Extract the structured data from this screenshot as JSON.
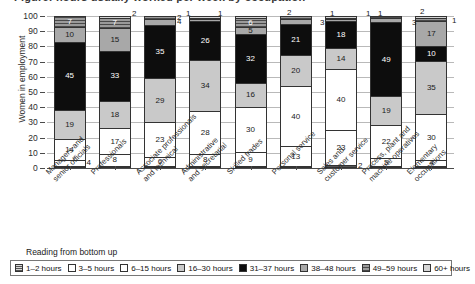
{
  "title_partial": "Figure: hours usually worked per week by occupation",
  "axis": {
    "ylabel": "Women in employment",
    "yticks": [
      "100",
      "90",
      "80",
      "70",
      "60",
      "50",
      "40",
      "30",
      "20",
      "10",
      "0"
    ],
    "ymin": 0,
    "ymax": 100
  },
  "legend": {
    "caption": "Reading from bottom up",
    "items": [
      {
        "label": "1–2 hours",
        "key": "h1"
      },
      {
        "label": "3–5 hours",
        "key": "h3"
      },
      {
        "label": "6–15 hours",
        "key": "h6"
      },
      {
        "label": "16–30 hours",
        "key": "h16"
      },
      {
        "label": "31–37 hours",
        "key": "h31"
      },
      {
        "label": "38–48 hours",
        "key": "h38"
      },
      {
        "label": "49–59 hours",
        "key": "h49"
      },
      {
        "label": "60+ hours",
        "key": "h60"
      }
    ]
  },
  "chart_data": {
    "type": "bar",
    "title": "Figure: hours usually worked per week by occupation",
    "xlabel": "",
    "ylabel": "Women in employment",
    "ylim": [
      0,
      100
    ],
    "grid": true,
    "stacked": true,
    "legend_position": "bottom",
    "categories": [
      "Managers and senior officials",
      "Professionals",
      "Associate professionals and technical",
      "Administrative and secretarial",
      "Skilled trades",
      "Personal service",
      "Sales and customer service",
      "Process, plant and machine operatives",
      "Elementary occupations"
    ],
    "series": [
      {
        "name": "1–2 hours",
        "key": "h1",
        "values": [
          1,
          1,
          1,
          1,
          1,
          1,
          2,
          1,
          1
        ]
      },
      {
        "name": "3–5 hours",
        "key": "h3",
        "values": [
          4,
          8,
          6,
          8,
          9,
          13,
          23,
          5,
          4
        ]
      },
      {
        "name": "6–15 hours",
        "key": "h6",
        "values": [
          14,
          17,
          23,
          28,
          30,
          40,
          40,
          22,
          30
        ]
      },
      {
        "name": "16–30 hours",
        "key": "h16",
        "values": [
          19,
          18,
          29,
          34,
          16,
          20,
          14,
          19,
          35
        ]
      },
      {
        "name": "31–37 hours",
        "key": "h31",
        "values": [
          45,
          33,
          35,
          26,
          32,
          21,
          18,
          49,
          10
        ]
      },
      {
        "name": "38–48 hours",
        "key": "h38",
        "values": [
          10,
          15,
          4,
          1,
          5,
          3,
          1,
          3,
          17
        ]
      },
      {
        "name": "49–59 hours",
        "key": "h49",
        "values": [
          7,
          7,
          2,
          1,
          6,
          2,
          1,
          1,
          2
        ]
      },
      {
        "name": "60+ hours",
        "key": "h60",
        "values": [
          0,
          1,
          0,
          1,
          1,
          0,
          1,
          0,
          1
        ]
      }
    ]
  },
  "bars": [
    {
      "category_l1": "Managers and",
      "category_l2": "senior officials",
      "segments": [
        {
          "key": "h1",
          "value": 1,
          "label": "",
          "callout": ""
        },
        {
          "key": "h3",
          "value": 4,
          "label": "",
          "callout": "4"
        },
        {
          "key": "h6",
          "value": 14,
          "label": "14",
          "callout": ""
        },
        {
          "key": "h16",
          "value": 19,
          "label": "19",
          "callout": ""
        },
        {
          "key": "h31",
          "value": 45,
          "label": "45",
          "callout": ""
        },
        {
          "key": "h38",
          "value": 10,
          "label": "10",
          "callout": ""
        },
        {
          "key": "h49",
          "value": 7,
          "label": "7",
          "callout": ""
        }
      ]
    },
    {
      "category_l1": "Professionals",
      "category_l2": "",
      "segments": [
        {
          "key": "h1",
          "value": 1,
          "label": "",
          "callout": ""
        },
        {
          "key": "h3",
          "value": 8,
          "label": "8",
          "callout": ""
        },
        {
          "key": "h6",
          "value": 17,
          "label": "17",
          "callout": ""
        },
        {
          "key": "h16",
          "value": 18,
          "label": "18",
          "callout": ""
        },
        {
          "key": "h31",
          "value": 33,
          "label": "33",
          "callout": ""
        },
        {
          "key": "h38",
          "value": 15,
          "label": "15",
          "callout": ""
        },
        {
          "key": "h49",
          "value": 7,
          "label": "7",
          "callout": ""
        },
        {
          "key": "h60",
          "value": 1,
          "label": "",
          "callout": ""
        }
      ]
    },
    {
      "category_l1": "Associate professionals",
      "category_l2": "and technical",
      "segments": [
        {
          "key": "h1",
          "value": 1,
          "label": "",
          "callout": ""
        },
        {
          "key": "h3",
          "value": 6,
          "label": "6",
          "callout": ""
        },
        {
          "key": "h6",
          "value": 23,
          "label": "23",
          "callout": ""
        },
        {
          "key": "h16",
          "value": 29,
          "label": "29",
          "callout": ""
        },
        {
          "key": "h31",
          "value": 35,
          "label": "35",
          "callout": ""
        },
        {
          "key": "h38",
          "value": 4,
          "label": "",
          "callout": "4"
        },
        {
          "key": "h49",
          "value": 2,
          "label": "",
          "callout": "2"
        }
      ]
    },
    {
      "category_l1": "Administrative",
      "category_l2": "and secretarial",
      "segments": [
        {
          "key": "h1",
          "value": 1,
          "label": "",
          "callout": ""
        },
        {
          "key": "h3",
          "value": 8,
          "label": "8",
          "callout": ""
        },
        {
          "key": "h6",
          "value": 28,
          "label": "28",
          "callout": ""
        },
        {
          "key": "h16",
          "value": 34,
          "label": "34",
          "callout": ""
        },
        {
          "key": "h31",
          "value": 26,
          "label": "26",
          "callout": ""
        },
        {
          "key": "h38",
          "value": 1,
          "label": "",
          "callout": ""
        },
        {
          "key": "h49",
          "value": 1,
          "label": "",
          "callout": ""
        },
        {
          "key": "h60",
          "value": 1,
          "label": "",
          "callout": ""
        }
      ]
    },
    {
      "category_l1": "Skilled trades",
      "category_l2": "",
      "segments": [
        {
          "key": "h1",
          "value": 1,
          "label": "",
          "callout": ""
        },
        {
          "key": "h3",
          "value": 9,
          "label": "9",
          "callout": ""
        },
        {
          "key": "h6",
          "value": 30,
          "label": "30",
          "callout": ""
        },
        {
          "key": "h16",
          "value": 16,
          "label": "16",
          "callout": ""
        },
        {
          "key": "h31",
          "value": 32,
          "label": "32",
          "callout": ""
        },
        {
          "key": "h38",
          "value": 5,
          "label": "5",
          "callout": ""
        },
        {
          "key": "h49",
          "value": 6,
          "label": "6",
          "callout": ""
        },
        {
          "key": "h60",
          "value": 1,
          "label": "",
          "callout": ""
        }
      ]
    },
    {
      "category_l1": "Personal service",
      "category_l2": "",
      "segments": [
        {
          "key": "h1",
          "value": 1,
          "label": "",
          "callout": ""
        },
        {
          "key": "h3",
          "value": 13,
          "label": "13",
          "callout": ""
        },
        {
          "key": "h6",
          "value": 40,
          "label": "40",
          "callout": ""
        },
        {
          "key": "h16",
          "value": 20,
          "label": "20",
          "callout": ""
        },
        {
          "key": "h31",
          "value": 21,
          "label": "21",
          "callout": ""
        },
        {
          "key": "h38",
          "value": 3,
          "label": "",
          "callout": "3"
        },
        {
          "key": "h49",
          "value": 2,
          "label": "",
          "callout": "2"
        }
      ]
    },
    {
      "category_l1": "Sales and",
      "category_l2": "customer service",
      "segments": [
        {
          "key": "h1",
          "value": 2,
          "label": "",
          "callout": "2"
        },
        {
          "key": "h3",
          "value": 23,
          "label": "23",
          "callout": ""
        },
        {
          "key": "h6",
          "value": 40,
          "label": "40",
          "callout": ""
        },
        {
          "key": "h16",
          "value": 14,
          "label": "14",
          "callout": ""
        },
        {
          "key": "h31",
          "value": 18,
          "label": "18",
          "callout": ""
        },
        {
          "key": "h38",
          "value": 1,
          "label": "",
          "callout": ""
        },
        {
          "key": "h49",
          "value": 1,
          "label": "",
          "callout": ""
        },
        {
          "key": "h60",
          "value": 1,
          "label": "",
          "callout": ""
        }
      ]
    },
    {
      "category_l1": "Process, plant and",
      "category_l2": "machine operatives",
      "segments": [
        {
          "key": "h1",
          "value": 1,
          "label": "",
          "callout": ""
        },
        {
          "key": "h3",
          "value": 5,
          "label": "5",
          "callout": ""
        },
        {
          "key": "h6",
          "value": 22,
          "label": "22",
          "callout": ""
        },
        {
          "key": "h16",
          "value": 19,
          "label": "19",
          "callout": ""
        },
        {
          "key": "h31",
          "value": 49,
          "label": "49",
          "callout": ""
        },
        {
          "key": "h38",
          "value": 3,
          "label": "",
          "callout": "3"
        },
        {
          "key": "h49",
          "value": 1,
          "label": "",
          "callout": ""
        }
      ]
    },
    {
      "category_l1": "Elementary",
      "category_l2": "occupations",
      "segments": [
        {
          "key": "h1",
          "value": 1,
          "label": "",
          "callout": ""
        },
        {
          "key": "h3",
          "value": 4,
          "label": "4",
          "callout": ""
        },
        {
          "key": "h6",
          "value": 30,
          "label": "30",
          "callout": ""
        },
        {
          "key": "h16",
          "value": 35,
          "label": "35",
          "callout": ""
        },
        {
          "key": "h31",
          "value": 10,
          "label": "10",
          "callout": ""
        },
        {
          "key": "h38",
          "value": 17,
          "label": "17",
          "callout": ""
        },
        {
          "key": "h49",
          "value": 2,
          "label": "",
          "callout": "2"
        },
        {
          "key": "h60",
          "value": 1,
          "label": "",
          "callout": "1"
        }
      ]
    }
  ],
  "callout_marks": [
    {
      "bar": 2,
      "text": "2",
      "x": 132,
      "y": 9
    },
    {
      "bar": 3,
      "text": "1",
      "x": 186,
      "y": 9
    },
    {
      "bar": 4,
      "text": "1",
      "x": 218,
      "y": 9
    },
    {
      "bar": 6,
      "text": "2",
      "x": 287,
      "y": 8
    },
    {
      "bar": 6,
      "text": "3",
      "x": 320,
      "y": 18
    },
    {
      "bar": 7,
      "text": "1",
      "x": 330,
      "y": 9
    },
    {
      "bar": 7,
      "text": "1",
      "x": 366,
      "y": 9
    },
    {
      "bar": 8,
      "text": "1",
      "x": 378,
      "y": 9
    },
    {
      "bar": 8,
      "text": "3",
      "x": 412,
      "y": 18
    },
    {
      "bar": 9,
      "text": "2",
      "x": 420,
      "y": 7
    },
    {
      "bar": 9,
      "text": "1",
      "x": 452,
      "y": 16
    }
  ]
}
